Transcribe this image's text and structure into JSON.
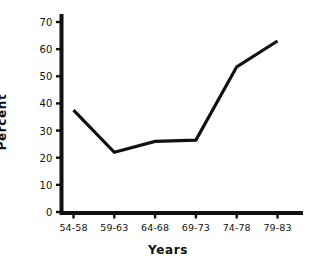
{
  "chart_data": {
    "type": "line",
    "title": "",
    "xlabel": "Years",
    "ylabel": "Percent",
    "categories": [
      "54-58",
      "59-63",
      "64-68",
      "69-73",
      "74-78",
      "79-83"
    ],
    "values": [
      37.5,
      22,
      26,
      26.5,
      53.5,
      63
    ],
    "series": [
      {
        "name": "Percent",
        "values": [
          37.5,
          22,
          26,
          26.5,
          53.5,
          63
        ]
      }
    ],
    "ylim": [
      0,
      73
    ],
    "yticks": [
      0,
      10,
      20,
      30,
      40,
      50,
      60,
      70
    ],
    "ytick_labels": [
      "0",
      "10",
      "20",
      "30",
      "40",
      "50",
      "60",
      "70"
    ],
    "xtick_labels": [
      "54-58",
      "59-63",
      "64-68",
      "69-73",
      "74-78",
      "79-83"
    ],
    "grid": false,
    "legend": false,
    "line_color": "#111111",
    "background_color": "#ffffff",
    "axis_color": "#111111",
    "markers": false
  }
}
